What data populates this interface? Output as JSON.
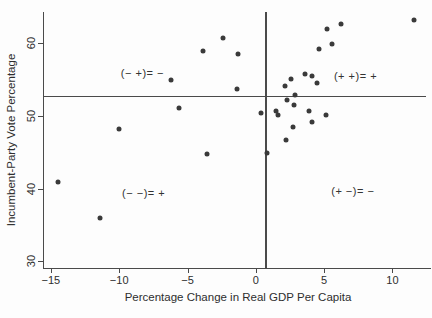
{
  "chart_data": {
    "type": "scatter",
    "title": "",
    "xlabel": "Percentage Change in Real GDP Per Capita",
    "ylabel": "Incumbent-Party Vote Percentage",
    "x_ticks": [
      -15,
      -10,
      -5,
      0,
      5,
      10
    ],
    "y_ticks": [
      30,
      40,
      50,
      60
    ],
    "xlim": [
      -15.5,
      12.75
    ],
    "ylim": [
      29.1,
      64.2
    ],
    "grid": false,
    "legend": null,
    "point_color": "#3a3a3a",
    "reference_lines": {
      "horizontal_y": 52.7,
      "vertical_x": 0.7
    },
    "quadrant_labels": [
      {
        "text": "(− +)= −",
        "x": -8.3,
        "y": 55.9
      },
      {
        "text": "(+ +)= +",
        "x": 7.3,
        "y": 55.5
      },
      {
        "text": "(− −)= +",
        "x": -8.2,
        "y": 39.4
      },
      {
        "text": "(+ −)= −",
        "x": 7.1,
        "y": 39.6
      }
    ],
    "points": [
      [
        -14.5,
        40.9
      ],
      [
        -11.4,
        35.9
      ],
      [
        -10.0,
        48.1
      ],
      [
        -6.2,
        54.9
      ],
      [
        -5.6,
        51.0
      ],
      [
        -3.9,
        58.8
      ],
      [
        -3.6,
        44.8
      ],
      [
        -2.4,
        60.7
      ],
      [
        -1.3,
        58.4
      ],
      [
        -1.4,
        53.6
      ],
      [
        0.4,
        50.3
      ],
      [
        0.8,
        44.9
      ],
      [
        1.5,
        50.7
      ],
      [
        1.6,
        50.1
      ],
      [
        2.2,
        46.7
      ],
      [
        2.1,
        54.0
      ],
      [
        2.3,
        52.2
      ],
      [
        2.6,
        55.0
      ],
      [
        2.7,
        48.4
      ],
      [
        2.9,
        52.8
      ],
      [
        2.8,
        51.5
      ],
      [
        3.6,
        55.7
      ],
      [
        4.1,
        55.5
      ],
      [
        3.9,
        50.7
      ],
      [
        4.1,
        49.1
      ],
      [
        4.5,
        54.5
      ],
      [
        4.6,
        59.2
      ],
      [
        5.6,
        59.8
      ],
      [
        5.2,
        61.9
      ],
      [
        6.2,
        62.6
      ],
      [
        5.1,
        50.1
      ],
      [
        11.6,
        63.1
      ]
    ]
  }
}
